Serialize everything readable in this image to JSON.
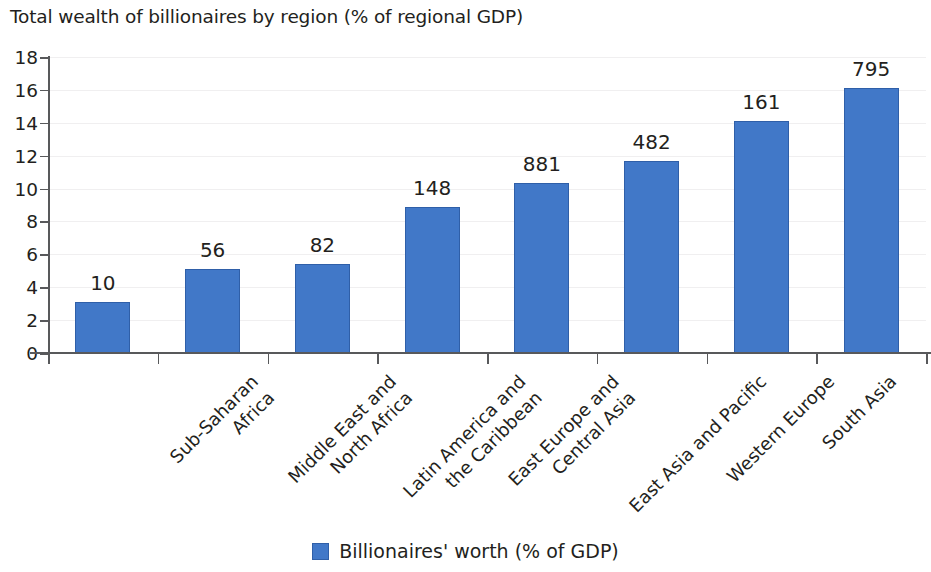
{
  "chart_data": {
    "type": "bar",
    "title": "Total wealth of billionaires by region (% of regional GDP)",
    "xlabel": "",
    "ylabel": "",
    "ylim": [
      0,
      18
    ],
    "ytick_step": 2,
    "yticks": [
      "0",
      "2",
      "4",
      "6",
      "8",
      "10",
      "12",
      "14",
      "16",
      "18"
    ],
    "grid": true,
    "legend_position": "bottom-center",
    "categories": [
      "Sub-Saharan Africa",
      "Middle East and North Africa",
      "Latin America and the Caribbean",
      "East Europe and Central Asia",
      "East Asia and Pacific",
      "Western Europe",
      "South Asia",
      "North America"
    ],
    "category_lines": [
      [
        "Sub-Saharan",
        "Africa"
      ],
      [
        "Middle East and",
        "North Africa"
      ],
      [
        "Latin America and",
        "the Caribbean"
      ],
      [
        "East Europe and",
        "Central Asia"
      ],
      [
        "East Asia and Pacific"
      ],
      [
        "Western Europe"
      ],
      [
        "South Asia"
      ],
      [
        "North America"
      ]
    ],
    "series": [
      {
        "name": "Billionaires' worth (% of GDP)",
        "color": "#4178c8",
        "values": [
          3.1,
          5.1,
          5.4,
          8.9,
          10.35,
          11.7,
          14.1,
          16.1
        ],
        "point_labels": [
          "10",
          "56",
          "82",
          "148",
          "881",
          "482",
          "161",
          "795"
        ]
      }
    ],
    "legend": [
      "Billionaires' worth (% of GDP)"
    ]
  },
  "legend": {
    "swatch_color": "#4178c8",
    "label": "Billionaires' worth (% of GDP)"
  },
  "axis": {
    "line_color": "#58595b",
    "grid_color": "#f0eff0"
  }
}
